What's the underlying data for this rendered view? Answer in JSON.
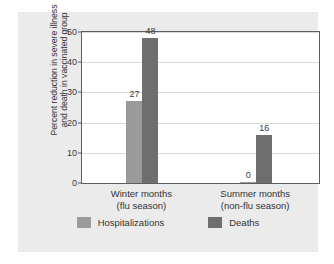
{
  "chart_data": {
    "type": "bar",
    "title": "",
    "subtitle": "",
    "xlabel": "",
    "ylabel_line1": "Percent reduction in severe illness",
    "ylabel_line2": "and death in vaccinated group",
    "categories": [
      "Winter months\n(flu season)",
      "Summer months\n(non-flu season)"
    ],
    "category_labels": [
      {
        "line1": "Winter months",
        "line2": "(flu season)"
      },
      {
        "line1": "Summer months",
        "line2": "(non-flu season)"
      }
    ],
    "series": [
      {
        "name": "Hospitalizations",
        "color": "#9a9a9a",
        "values": [
          27,
          0
        ],
        "value_labels": [
          "27",
          "0"
        ]
      },
      {
        "name": "Deaths",
        "color": "#6e6e6e",
        "values": [
          48,
          16
        ],
        "value_labels": [
          "48",
          "16"
        ]
      }
    ],
    "ylim": [
      0,
      50
    ],
    "yticks": [
      0,
      10,
      20,
      30,
      40,
      50
    ],
    "ytick_labels": [
      "0",
      "10",
      "20",
      "30",
      "40",
      "50"
    ],
    "grid": true,
    "legend_position": "bottom",
    "legend": [
      "Hospitalizations",
      "Deaths"
    ],
    "plot_background": "#ffffff",
    "figure_background": "#ebebeb",
    "axis_color": "#5d5d5d",
    "grid_color": "#d8d8d8"
  }
}
